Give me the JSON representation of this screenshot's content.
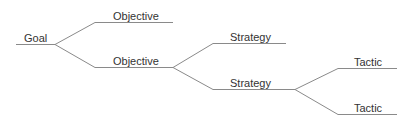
{
  "diagram": {
    "type": "tree",
    "line_color": "#8a8a8a",
    "text_color": "#333333",
    "nodes": [
      {
        "id": "goal",
        "label": "Goal",
        "level": "goal"
      },
      {
        "id": "obj1",
        "label": "Objective",
        "level": "objective",
        "parent": "goal"
      },
      {
        "id": "obj2",
        "label": "Objective",
        "level": "objective",
        "parent": "goal"
      },
      {
        "id": "str1",
        "label": "Strategy",
        "level": "strategy",
        "parent": "obj2"
      },
      {
        "id": "str2",
        "label": "Strategy",
        "level": "strategy",
        "parent": "obj2"
      },
      {
        "id": "tac1",
        "label": "Tactic",
        "level": "tactic",
        "parent": "str2"
      },
      {
        "id": "tac2",
        "label": "Tactic",
        "level": "tactic",
        "parent": "str2"
      }
    ]
  }
}
